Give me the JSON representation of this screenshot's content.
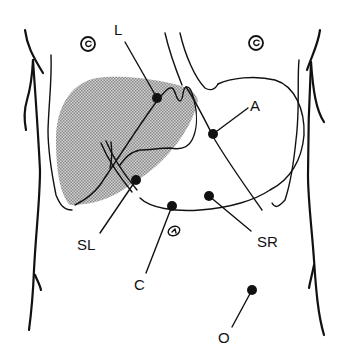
{
  "diagram": {
    "colors": {
      "line": "#111111",
      "liver_shade": "#b5b5b5",
      "background": "#ffffff"
    },
    "structures": [
      {
        "id": "liver",
        "name": "liver (shaded)"
      },
      {
        "id": "stomach",
        "name": "stomach outline"
      },
      {
        "id": "left-nipple",
        "name": "left nipple"
      },
      {
        "id": "right-nipple",
        "name": "right nipple"
      },
      {
        "id": "umbilicus",
        "name": "umbilicus"
      },
      {
        "id": "torso",
        "name": "torso contour"
      }
    ],
    "labels": [
      {
        "id": "L",
        "text": "L"
      },
      {
        "id": "A",
        "text": "A"
      },
      {
        "id": "SL",
        "text": "SL"
      },
      {
        "id": "SR",
        "text": "SR"
      },
      {
        "id": "C",
        "text": "C"
      },
      {
        "id": "O",
        "text": "O"
      }
    ]
  }
}
